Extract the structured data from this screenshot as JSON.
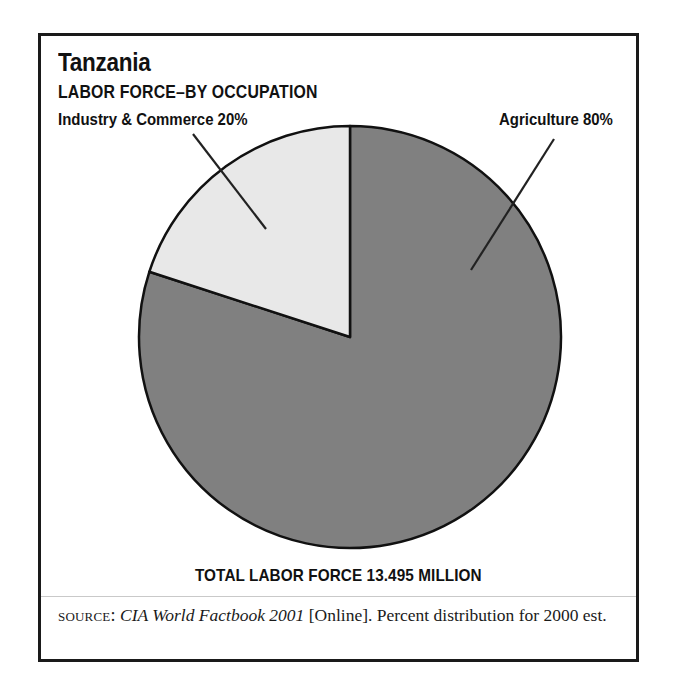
{
  "figure": {
    "country": "Tanzania",
    "subtitle": "LABOR FORCE–BY OCCUPATION",
    "total_caption": "TOTAL LABOR FORCE 13.495 MILLION"
  },
  "labels": {
    "industry": "Industry & Commerce 20%",
    "agriculture": "Agriculture 80%"
  },
  "source": {
    "kicker": "SOURCE:",
    "work": "CIA World Factbook 2001",
    "rest": "[Online]. Percent distribution for 2000 est."
  },
  "chart_data": {
    "type": "pie",
    "title": "Tanzania",
    "subtitle": "LABOR FORCE–BY OCCUPATION",
    "categories": [
      "Agriculture",
      "Industry & Commerce"
    ],
    "values": [
      80,
      20
    ],
    "value_unit": "percent",
    "data_labels": [
      "Agriculture 80%",
      "Industry & Commerce 20%"
    ],
    "colors": [
      "#808080",
      "#e8e8e8"
    ],
    "edge_color": "#111111",
    "start_angle_deg": 90,
    "direction": "counterclockwise",
    "legend": "none",
    "grid": false,
    "annotations": [
      "TOTAL LABOR FORCE 13.495 MILLION"
    ],
    "total_labor_force_million": 13.495,
    "source": "CIA World Factbook 2001 [Online]. Percent distribution for 2000 est."
  }
}
